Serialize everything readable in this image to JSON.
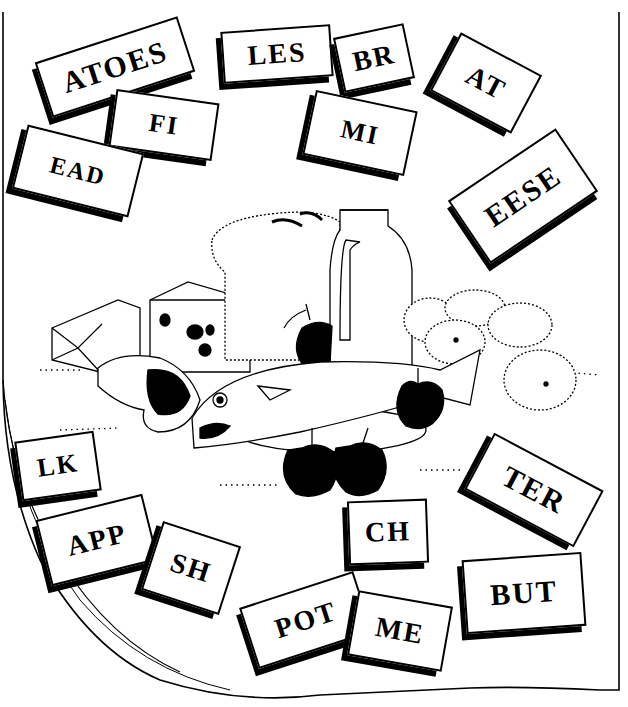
{
  "worksheet": {
    "colors": {
      "ink": "#000000",
      "paper": "#ffffff"
    },
    "cards": [
      {
        "id": "atoes",
        "label": "ATOES"
      },
      {
        "id": "les",
        "label": "LES"
      },
      {
        "id": "br",
        "label": "BR"
      },
      {
        "id": "at",
        "label": "AT"
      },
      {
        "id": "fi",
        "label": "FI"
      },
      {
        "id": "mi",
        "label": "MI"
      },
      {
        "id": "ead",
        "label": "EAD"
      },
      {
        "id": "eese",
        "label": "EESE"
      },
      {
        "id": "lk",
        "label": "LK"
      },
      {
        "id": "ter",
        "label": "TER"
      },
      {
        "id": "ch",
        "label": "CH"
      },
      {
        "id": "app",
        "label": "APP"
      },
      {
        "id": "sh",
        "label": "SH"
      },
      {
        "id": "but",
        "label": "BUT"
      },
      {
        "id": "pot",
        "label": "POT"
      },
      {
        "id": "me",
        "label": "ME"
      }
    ],
    "illustration": {
      "items": [
        "butter",
        "cheese",
        "bread",
        "milk-jug",
        "apple",
        "potatoes",
        "meat-chop",
        "fish",
        "plate",
        "apples"
      ]
    }
  }
}
